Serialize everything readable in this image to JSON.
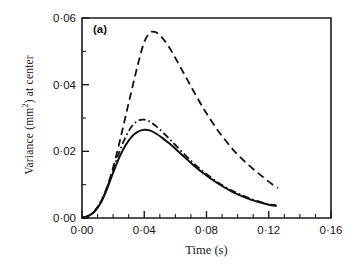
{
  "figure": {
    "panel_label": "(a)",
    "axis_color": "#1a1a1a",
    "curve_color": "#111111",
    "background": "#ffffff"
  },
  "axes": {
    "y_tick_labels": [
      "0·00",
      "0·02",
      "0·04",
      "0·06"
    ],
    "x_tick_labels": [
      "0·00",
      "0·04",
      "0·08",
      "0·12",
      "0·16"
    ],
    "ylabel_main": "Variance (mm",
    "ylabel_sup": "2",
    "ylabel_tail": ") at center",
    "xlabel": "Time (s)"
  },
  "chart_data": {
    "type": "line",
    "title": "",
    "subtitle": "",
    "annotations": [
      "(a)"
    ],
    "xlabel": "Time (s)",
    "ylabel": "Variance (mm^2) at center",
    "xlim": [
      0.0,
      0.16
    ],
    "ylim": [
      0.0,
      0.06
    ],
    "x_major_ticks": [
      0.0,
      0.04,
      0.08,
      0.12,
      0.16
    ],
    "y_major_ticks": [
      0.0,
      0.02,
      0.04,
      0.06
    ],
    "x_minor_tick_step": 0.01,
    "y_minor_tick_step": 0.01,
    "grid": false,
    "legend": "none",
    "series": [
      {
        "name": "dashed",
        "style": "dashed",
        "peak_x": 0.042,
        "peak_y": 0.056,
        "x": [
          0.0,
          0.004,
          0.008,
          0.012,
          0.016,
          0.02,
          0.024,
          0.028,
          0.032,
          0.036,
          0.04,
          0.044,
          0.048,
          0.052,
          0.056,
          0.06,
          0.064,
          0.068,
          0.072,
          0.076,
          0.08,
          0.086,
          0.092,
          0.098,
          0.104,
          0.11,
          0.116,
          0.122,
          0.126
        ],
        "y": [
          0.0,
          0.0006,
          0.002,
          0.0048,
          0.0092,
          0.0152,
          0.0225,
          0.0305,
          0.0385,
          0.0462,
          0.0528,
          0.0557,
          0.0556,
          0.0538,
          0.0512,
          0.048,
          0.0446,
          0.0412,
          0.0378,
          0.0345,
          0.0314,
          0.0271,
          0.0234,
          0.02,
          0.0172,
          0.0147,
          0.0124,
          0.0102,
          0.009
        ]
      },
      {
        "name": "dash-dot",
        "style": "dashdot",
        "peak_x": 0.039,
        "peak_y": 0.0295,
        "x": [
          0.0,
          0.004,
          0.008,
          0.012,
          0.016,
          0.02,
          0.024,
          0.028,
          0.032,
          0.036,
          0.04,
          0.044,
          0.048,
          0.052,
          0.056,
          0.06,
          0.066,
          0.072,
          0.078,
          0.084,
          0.09,
          0.096,
          0.102,
          0.108,
          0.114,
          0.12,
          0.125
        ],
        "y": [
          0.0,
          0.0006,
          0.002,
          0.0048,
          0.009,
          0.0144,
          0.0198,
          0.0243,
          0.0275,
          0.0292,
          0.0295,
          0.0288,
          0.0274,
          0.0257,
          0.0238,
          0.0219,
          0.019,
          0.0163,
          0.0139,
          0.0118,
          0.0099,
          0.0083,
          0.007,
          0.0058,
          0.0049,
          0.0041,
          0.0038
        ]
      },
      {
        "name": "solid",
        "style": "solid",
        "peak_x": 0.04,
        "peak_y": 0.0265,
        "x": [
          0.0,
          0.004,
          0.008,
          0.012,
          0.016,
          0.02,
          0.024,
          0.028,
          0.032,
          0.036,
          0.04,
          0.044,
          0.048,
          0.052,
          0.056,
          0.06,
          0.066,
          0.072,
          0.078,
          0.084,
          0.09,
          0.096,
          0.102,
          0.108,
          0.114,
          0.12,
          0.125
        ],
        "y": [
          0.0,
          0.0006,
          0.0019,
          0.0045,
          0.0086,
          0.0136,
          0.0182,
          0.0218,
          0.0244,
          0.0259,
          0.0265,
          0.0262,
          0.0252,
          0.0239,
          0.0224,
          0.0208,
          0.0182,
          0.0157,
          0.0134,
          0.0114,
          0.0096,
          0.008,
          0.0067,
          0.0056,
          0.0047,
          0.004,
          0.0036
        ]
      }
    ]
  }
}
